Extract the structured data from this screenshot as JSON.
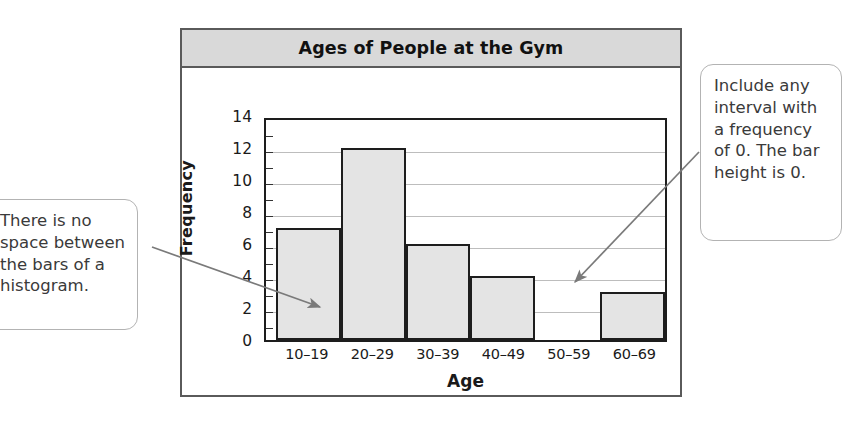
{
  "chart": {
    "title": "Ages of People at the Gym",
    "x_axis_title": "Age",
    "y_axis_title": "Frequency"
  },
  "chart_data": {
    "type": "bar",
    "title": "Ages of People at the Gym",
    "xlabel": "Age",
    "ylabel": "Frequency",
    "categories": [
      "10–19",
      "20–29",
      "30–39",
      "40–49",
      "50–59",
      "60–69"
    ],
    "values": [
      7,
      12,
      6,
      4,
      0,
      3
    ],
    "ylim": [
      0,
      14
    ],
    "ytick_step": 2,
    "yticks": [
      "14",
      "12",
      "10",
      "8",
      "6",
      "4",
      "2",
      "0"
    ],
    "ytick_values": [
      14,
      12,
      10,
      8,
      6,
      4,
      2,
      0
    ],
    "grid": true,
    "legend": "none",
    "bar_gap": 0
  },
  "annotations": {
    "left": {
      "text": "There is no space between the bars of a histogram."
    },
    "right": {
      "text": "Include any interval with a frequency of 0. The bar height is 0."
    }
  },
  "colors": {
    "bar_fill": "#e4e4e4",
    "bar_border": "#1d1d1d",
    "title_band": "#d9d9d9",
    "frame_border": "#5a5a5a",
    "gridline": "#bdbdbd",
    "callout_border": "#b3b3b3",
    "arrow": "#7a7a7a"
  }
}
